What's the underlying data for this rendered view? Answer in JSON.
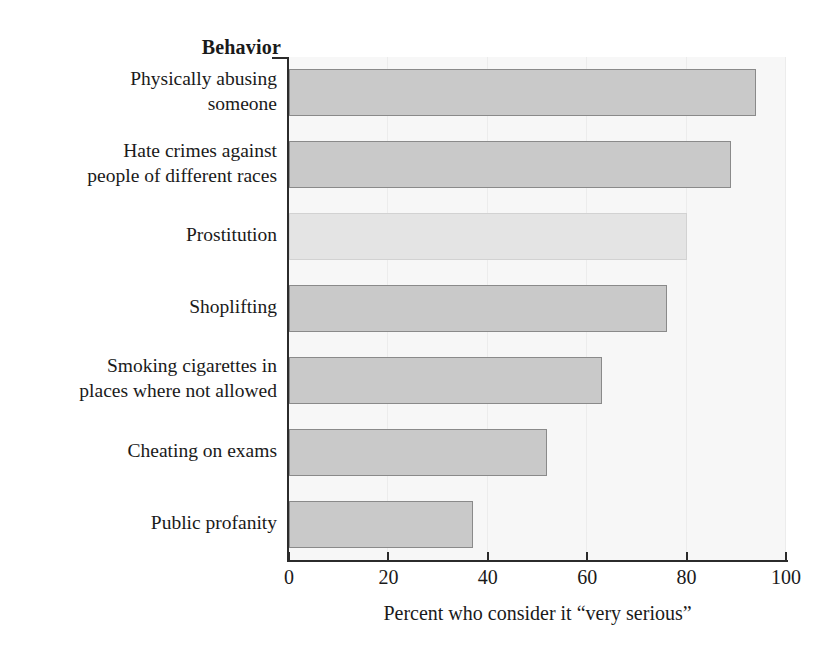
{
  "chart_data": {
    "type": "bar",
    "orientation": "horizontal",
    "title": "",
    "category_header": "Behavior",
    "categories": [
      "Physically abusing someone",
      "Hate crimes against people of different races",
      "Prostitution",
      "Shoplifting",
      "Smoking cigarettes in places where not allowed",
      "Cheating on exams",
      "Public profanity"
    ],
    "category_lines": [
      [
        "Physically abusing",
        "someone"
      ],
      [
        "Hate crimes against",
        "people of different races"
      ],
      [
        "Prostitution"
      ],
      [
        "Shoplifting"
      ],
      [
        "Smoking cigarettes in",
        "places where not allowed"
      ],
      [
        "Cheating on exams"
      ],
      [
        "Public profanity"
      ]
    ],
    "values": [
      94,
      89,
      80,
      76,
      63,
      52,
      37
    ],
    "xlabel": "Percent who consider it “very serious”",
    "ylabel": "Behavior",
    "xlim": [
      0,
      100
    ],
    "xticks": [
      0,
      20,
      40,
      60,
      80,
      100
    ],
    "xtick_labels": [
      "0",
      "20",
      "40",
      "60",
      "80",
      "100"
    ],
    "grid": "faint vertical gridlines at x ticks",
    "legend": "none",
    "highlighted_index": 2,
    "colors": {
      "bar_fill": "#c9c9c9",
      "bar_border": "#8a8a8a",
      "bar_fill_highlight": "#e4e4e4",
      "bar_border_highlight": "#d2d2d2",
      "plot_background": "#f7f7f7",
      "page_background": "#ffffff",
      "axis": "#2b2b2b",
      "text": "#1a1a1a",
      "gridline": "#ececec"
    }
  }
}
